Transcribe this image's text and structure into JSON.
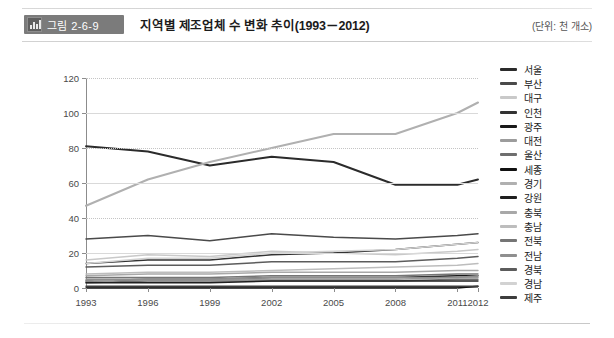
{
  "header": {
    "badge_label": "그림 2-6-9",
    "badge_icon": "bar-chart-icon",
    "title": "지역별 제조업체 수 변화 추이(1993－2012)",
    "unit": "(단위: 천 개소)"
  },
  "colors": {
    "badge_bg": "#7b7b7b",
    "axis": "#8c8c8c",
    "grid": "#c4c4c4",
    "text": "#222222"
  },
  "chart_data": {
    "type": "line",
    "title": "지역별 제조업체 수 변화 추이(1993－2012)",
    "xlabel": "",
    "ylabel": "",
    "unit": "천 개소",
    "grid": true,
    "legend_position": "right",
    "categories": [
      "1993",
      "1996",
      "1999",
      "2002",
      "2005",
      "2008",
      "2011",
      "2012"
    ],
    "x": [
      1993,
      1996,
      1999,
      2002,
      2005,
      2008,
      2011,
      2012
    ],
    "ylim": [
      0,
      120
    ],
    "yticks": [
      0,
      20,
      40,
      60,
      80,
      100,
      120
    ],
    "series": [
      {
        "name": "서울",
        "color": "#2b2b2b",
        "width": 1.9,
        "values": [
          81,
          78,
          70,
          75,
          72,
          59,
          59,
          62
        ]
      },
      {
        "name": "부산",
        "color": "#4a4a4a",
        "width": 1.5,
        "values": [
          28,
          30,
          27,
          31,
          29,
          28,
          30,
          31
        ]
      },
      {
        "name": "대구",
        "color": "#c9c9c9",
        "width": 1.5,
        "values": [
          16,
          19,
          18,
          21,
          20,
          19,
          21,
          22
        ]
      },
      {
        "name": "인천",
        "color": "#333333",
        "width": 1.5,
        "values": [
          14,
          16,
          16,
          19,
          20,
          22,
          25,
          26
        ]
      },
      {
        "name": "광주",
        "color": "#1a1a1a",
        "width": 1.4,
        "values": [
          4,
          5,
          5,
          6,
          6,
          6,
          7,
          7
        ]
      },
      {
        "name": "대전",
        "color": "#9c9c9c",
        "width": 1.4,
        "values": [
          4,
          5,
          5,
          5,
          5,
          5,
          6,
          6
        ]
      },
      {
        "name": "울산",
        "color": "#6e6e6e",
        "width": 1.4,
        "values": [
          3,
          4,
          4,
          4,
          4,
          4,
          5,
          5
        ]
      },
      {
        "name": "세종",
        "color": "#111111",
        "width": 1.4,
        "values": [
          0,
          0,
          0,
          0,
          0,
          0,
          0,
          1
        ]
      },
      {
        "name": "경기",
        "color": "#b0b0b0",
        "width": 2.0,
        "values": [
          47,
          62,
          72,
          80,
          88,
          88,
          100,
          106
        ]
      },
      {
        "name": "강원",
        "color": "#1f1f1f",
        "width": 1.4,
        "values": [
          3,
          3,
          3,
          4,
          4,
          4,
          4,
          4
        ]
      },
      {
        "name": "충북",
        "color": "#a8a8a8",
        "width": 1.4,
        "values": [
          7,
          8,
          8,
          9,
          9,
          9,
          10,
          10
        ]
      },
      {
        "name": "충남",
        "color": "#bdbdbd",
        "width": 1.4,
        "values": [
          8,
          9,
          9,
          10,
          11,
          12,
          13,
          14
        ]
      },
      {
        "name": "전북",
        "color": "#757575",
        "width": 1.4,
        "values": [
          6,
          6,
          6,
          7,
          7,
          7,
          8,
          8
        ]
      },
      {
        "name": "전남",
        "color": "#8f8f8f",
        "width": 1.4,
        "values": [
          5,
          5,
          5,
          6,
          6,
          6,
          6,
          7
        ]
      },
      {
        "name": "경북",
        "color": "#5c5c5c",
        "width": 1.5,
        "values": [
          12,
          13,
          13,
          15,
          15,
          15,
          17,
          18
        ]
      },
      {
        "name": "경남",
        "color": "#d2d2d2",
        "width": 1.5,
        "values": [
          14,
          17,
          17,
          20,
          21,
          22,
          25,
          26
        ]
      },
      {
        "name": "제주",
        "color": "#3d3d3d",
        "width": 1.4,
        "values": [
          1,
          1,
          1,
          1,
          1,
          1,
          1,
          1
        ]
      }
    ]
  }
}
